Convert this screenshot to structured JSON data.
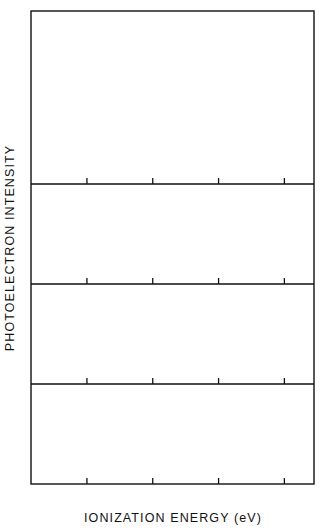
{
  "figure": {
    "xlabel": "IONIZATION ENERGY  (eV)",
    "ylabel": "PHOTOELECTRON  INTENSITY",
    "xticks": [
      "10",
      "9",
      "8",
      "7"
    ],
    "xtick_values": [
      10,
      9,
      8,
      7
    ],
    "panel_labels": [
      "CsF",
      "CsCl",
      "CsBr",
      "CsI"
    ],
    "ink_color": "#111111",
    "background_color": "#ffffff"
  },
  "chart_data": {
    "type": "scatter",
    "title": "",
    "xlabel": "IONIZATION ENERGY (eV)",
    "ylabel": "PHOTOELECTRON INTENSITY",
    "xlim": [
      10.85,
      6.55
    ],
    "x_axis_inverted": true,
    "xticks": [
      10,
      9,
      8,
      7
    ],
    "grid": false,
    "legend": "none",
    "n_panels": 4,
    "panels": [
      {
        "name": "CsF",
        "label": "CsF",
        "ylim": [
          0,
          1
        ],
        "peaks": [
          {
            "x": 10.35,
            "y": 1.0
          }
        ],
        "description": "Single broad asymmetric band peaking near 10.35 eV with a long tail decreasing toward 7 eV",
        "x": [
          10.8,
          10.74,
          10.68,
          10.62,
          10.56,
          10.5,
          10.44,
          10.38,
          10.32,
          10.26,
          10.2,
          10.14,
          10.08,
          10.02,
          9.96,
          9.9,
          9.84,
          9.78,
          9.72,
          9.66,
          9.6,
          9.54,
          9.48,
          9.42,
          9.36,
          9.3,
          9.24,
          9.18,
          9.12,
          9.06,
          9.0,
          8.94,
          8.88,
          8.82,
          8.76,
          8.7,
          8.64,
          8.58,
          8.52,
          8.46,
          8.4,
          8.34,
          8.28,
          8.22,
          8.16,
          8.1,
          8.04,
          7.98,
          7.92,
          7.86,
          7.8,
          7.74,
          7.68,
          7.62,
          7.56,
          7.5,
          7.44,
          7.38,
          7.32,
          7.26,
          7.2,
          7.14,
          7.08,
          7.02,
          6.96,
          6.9,
          6.84,
          6.78,
          6.72,
          6.66,
          6.6
        ],
        "y": [
          0.36,
          0.33,
          0.32,
          0.34,
          0.33,
          0.35,
          0.34,
          0.36,
          0.38,
          0.37,
          0.4,
          0.42,
          0.41,
          0.45,
          0.44,
          0.48,
          0.47,
          0.52,
          0.5,
          0.54,
          0.57,
          0.56,
          0.6,
          0.58,
          0.63,
          0.66,
          0.7,
          0.69,
          0.74,
          0.78,
          0.82,
          0.86,
          0.9,
          0.94,
          0.97,
          1.0,
          0.95,
          0.88,
          0.84,
          0.78,
          0.72,
          0.74,
          0.7,
          0.65,
          0.62,
          0.58,
          0.56,
          0.52,
          0.49,
          0.46,
          0.44,
          0.4,
          0.38,
          0.36,
          0.37,
          0.33,
          0.31,
          0.3,
          0.28,
          0.29,
          0.26,
          0.24,
          0.25,
          0.22,
          0.2,
          0.21,
          0.18,
          0.16,
          0.17,
          0.14,
          0.12
        ]
      },
      {
        "name": "CsCl",
        "label": "CsCl",
        "ylim": [
          0,
          1
        ],
        "peaks": [
          {
            "x": 8.3,
            "y": 1.0
          }
        ],
        "description": "Single broad symmetric band centred near 8.3 eV on a flat low baseline",
        "x": [
          9.8,
          9.72,
          9.64,
          9.56,
          9.48,
          9.4,
          9.32,
          9.24,
          9.16,
          9.08,
          9.0,
          8.92,
          8.84,
          8.76,
          8.68,
          8.6,
          8.52,
          8.44,
          8.36,
          8.28,
          8.2,
          8.12,
          8.04,
          7.96,
          7.88,
          7.8,
          7.72,
          7.64,
          7.56,
          7.48,
          7.4,
          7.32,
          7.24,
          7.16,
          7.08,
          7.0,
          6.92,
          6.84,
          6.76,
          6.68,
          6.6
        ],
        "y": [
          0.12,
          0.13,
          0.12,
          0.14,
          0.13,
          0.15,
          0.17,
          0.16,
          0.19,
          0.22,
          0.26,
          0.32,
          0.4,
          0.5,
          0.62,
          0.74,
          0.86,
          0.95,
          1.0,
          0.96,
          0.86,
          0.72,
          0.58,
          0.44,
          0.34,
          0.27,
          0.22,
          0.19,
          0.17,
          0.16,
          0.15,
          0.16,
          0.14,
          0.15,
          0.14,
          0.15,
          0.13,
          0.14,
          0.13,
          0.14,
          0.13
        ]
      },
      {
        "name": "CsBr",
        "label": "CsBr",
        "ylim": [
          0,
          1
        ],
        "peaks": [
          {
            "x": 8.55,
            "y": 0.72
          },
          {
            "x": 8.1,
            "y": 1.0
          }
        ],
        "description": "Broad band with a resolved shoulder near 8.55 eV and main maximum near 8.1 eV",
        "x": [
          9.7,
          9.62,
          9.54,
          9.46,
          9.38,
          9.3,
          9.22,
          9.14,
          9.06,
          8.98,
          8.9,
          8.82,
          8.74,
          8.66,
          8.58,
          8.5,
          8.42,
          8.34,
          8.26,
          8.18,
          8.1,
          8.02,
          7.94,
          7.86,
          7.78,
          7.7,
          7.62,
          7.54,
          7.46,
          7.38,
          7.3,
          7.22,
          7.14,
          7.06,
          6.98,
          6.9,
          6.82,
          6.74,
          6.66,
          6.6
        ],
        "y": [
          0.11,
          0.13,
          0.14,
          0.15,
          0.15,
          0.16,
          0.16,
          0.15,
          0.14,
          0.16,
          0.22,
          0.34,
          0.46,
          0.58,
          0.7,
          0.72,
          0.74,
          0.82,
          0.92,
          0.98,
          1.0,
          0.92,
          0.78,
          0.62,
          0.48,
          0.36,
          0.27,
          0.21,
          0.17,
          0.15,
          0.14,
          0.13,
          0.14,
          0.13,
          0.12,
          0.13,
          0.12,
          0.13,
          0.12,
          0.12
        ]
      },
      {
        "name": "CsI",
        "label": "CsI",
        "ylim": [
          0,
          1
        ],
        "peaks": [
          {
            "x": 8.5,
            "y": 0.82
          },
          {
            "x": 7.52,
            "y": 1.0
          }
        ],
        "description": "Clearly resolved spin-orbit doublet with maxima near 8.50 eV and 7.52 eV separated by a deep minimum near 8.0 eV",
        "x": [
          9.6,
          9.52,
          9.44,
          9.36,
          9.28,
          9.2,
          9.12,
          9.04,
          8.96,
          8.88,
          8.8,
          8.72,
          8.64,
          8.56,
          8.48,
          8.4,
          8.32,
          8.24,
          8.16,
          8.08,
          8.0,
          7.92,
          7.84,
          7.76,
          7.68,
          7.6,
          7.52,
          7.44,
          7.36,
          7.28,
          7.2,
          7.12,
          7.04,
          6.96,
          6.88,
          6.8,
          6.72,
          6.64,
          6.58
        ],
        "y": [
          0.13,
          0.14,
          0.13,
          0.15,
          0.14,
          0.16,
          0.15,
          0.17,
          0.18,
          0.2,
          0.24,
          0.32,
          0.46,
          0.64,
          0.8,
          0.82,
          0.7,
          0.52,
          0.38,
          0.3,
          0.27,
          0.3,
          0.4,
          0.58,
          0.8,
          0.95,
          1.0,
          0.9,
          0.74,
          0.58,
          0.44,
          0.33,
          0.26,
          0.21,
          0.18,
          0.16,
          0.15,
          0.14,
          0.13
        ]
      }
    ]
  }
}
